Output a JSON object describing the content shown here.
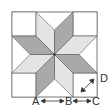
{
  "diagram": {
    "labels": {
      "a": "A",
      "b": "B",
      "c": "C",
      "d": "D"
    },
    "colors": {
      "dark": "#a9a9a9",
      "light": "#e4e4e4",
      "white": "#ffffff",
      "stroke": "#555555"
    }
  }
}
